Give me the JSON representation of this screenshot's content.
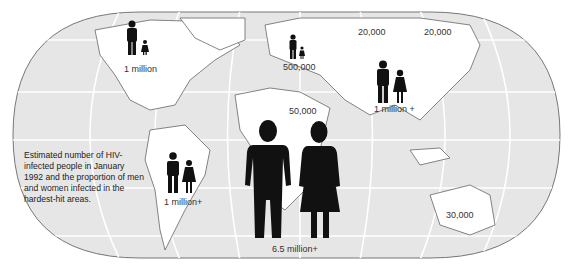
{
  "map": {
    "projection": "world-rounded-rectangle",
    "ocean_color": "#e6e6e6",
    "land_color": "#ffffff",
    "gridline_color": "#ffffff",
    "figure_color": "#111111"
  },
  "caption": "Estimated number of HIV-infected people in January 1992 and the proportion of men and women infected in the hardest-hit areas.",
  "regions": [
    {
      "name": "North America",
      "label": "1 million",
      "figures": true
    },
    {
      "name": "Europe",
      "label": "500,000",
      "figures": true
    },
    {
      "name": "Former USSR",
      "label": "20,000",
      "figures": false
    },
    {
      "name": "East Asia",
      "label": "20,000",
      "figures": false
    },
    {
      "name": "South and Southeast Asia",
      "label": "1 million +",
      "figures": true
    },
    {
      "name": "North Africa / Middle East",
      "label": "50,000",
      "figures": false
    },
    {
      "name": "Latin America",
      "label": "1 million+",
      "figures": true
    },
    {
      "name": "Sub-Saharan Africa",
      "label": "6.5 million+",
      "figures": true
    },
    {
      "name": "Australia",
      "label": "30,000",
      "figures": false
    }
  ]
}
